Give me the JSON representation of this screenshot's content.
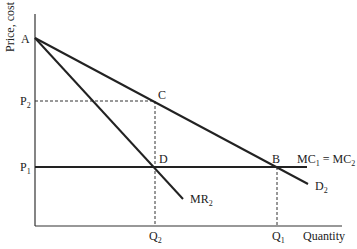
{
  "axes": {
    "y_label": "Price, cost",
    "x_label": "Quantity"
  },
  "points": {
    "A": "A",
    "B": "B",
    "C": "C",
    "D": "D"
  },
  "price_levels": {
    "p1": {
      "base": "P",
      "sub": "1"
    },
    "p2": {
      "base": "P",
      "sub": "2"
    }
  },
  "quantity_levels": {
    "q1": {
      "base": "Q",
      "sub": "1"
    },
    "q2": {
      "base": "Q",
      "sub": "2"
    }
  },
  "curves": {
    "demand": {
      "base": "D",
      "sub": "2"
    },
    "marginal_revenue": {
      "base": "MR",
      "sub": "2"
    },
    "marginal_cost": {
      "base1": "MC",
      "sub1": "1",
      "eq": " = ",
      "base2": "MC",
      "sub2": "2"
    }
  },
  "colors": {
    "line": "#222222",
    "background": "#ffffff"
  }
}
